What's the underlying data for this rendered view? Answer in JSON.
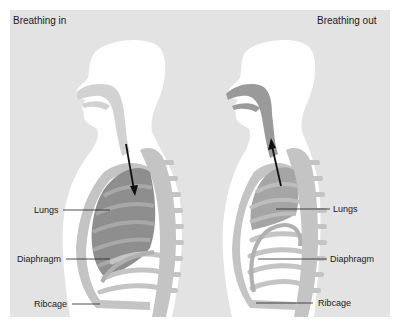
{
  "diagram": {
    "panels": [
      {
        "title": "Breathing in",
        "arrow_direction": "down",
        "labels": {
          "lungs": "Lungs",
          "diaphragm": "Diaphragm",
          "ribcage": "Ribcage"
        }
      },
      {
        "title": "Breathing out",
        "arrow_direction": "up",
        "labels": {
          "lungs": "Lungs",
          "diaphragm": "Diaphragm",
          "ribcage": "Ribcage"
        }
      }
    ],
    "colors": {
      "background": "#e3e3e3",
      "body": "#ffffff",
      "bone": "#c4c4c4",
      "lung_in": "#8e8e8e",
      "lung_out": "#a5a5a5",
      "airway_in": "#d2d2d2",
      "airway_out": "#9a9a9a",
      "arrow": "#111111"
    }
  }
}
